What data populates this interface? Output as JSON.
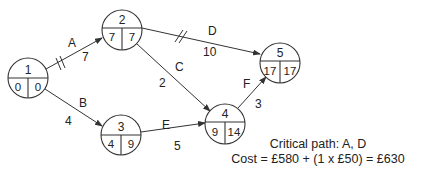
{
  "diagram": {
    "type": "activity-on-arrow network",
    "nodes": [
      {
        "id": "1",
        "earliest": "0",
        "latest": "0",
        "x": 28,
        "y": 78
      },
      {
        "id": "2",
        "earliest": "7",
        "latest": "7",
        "x": 122,
        "y": 30
      },
      {
        "id": "3",
        "earliest": "4",
        "latest": "9",
        "x": 121,
        "y": 135
      },
      {
        "id": "4",
        "earliest": "9",
        "latest": "14",
        "x": 225,
        "y": 124
      },
      {
        "id": "5",
        "earliest": "17",
        "latest": "17",
        "x": 280,
        "y": 63
      }
    ],
    "edges": [
      {
        "activity": "A",
        "duration": "7",
        "from": "1",
        "to": "2",
        "critical": true
      },
      {
        "activity": "B",
        "duration": "4",
        "from": "1",
        "to": "3",
        "critical": false
      },
      {
        "activity": "C",
        "duration": "2",
        "from": "2",
        "to": "4",
        "critical": false
      },
      {
        "activity": "D",
        "duration": "10",
        "from": "2",
        "to": "5",
        "critical": true
      },
      {
        "activity": "E",
        "duration": "5",
        "from": "3",
        "to": "4",
        "critical": false
      },
      {
        "activity": "F",
        "duration": "3",
        "from": "4",
        "to": "5",
        "critical": false
      }
    ]
  },
  "summary": {
    "critical_path": "Critical path: A, D",
    "cost": "Cost = £580 + (1 x £50) = £630"
  }
}
